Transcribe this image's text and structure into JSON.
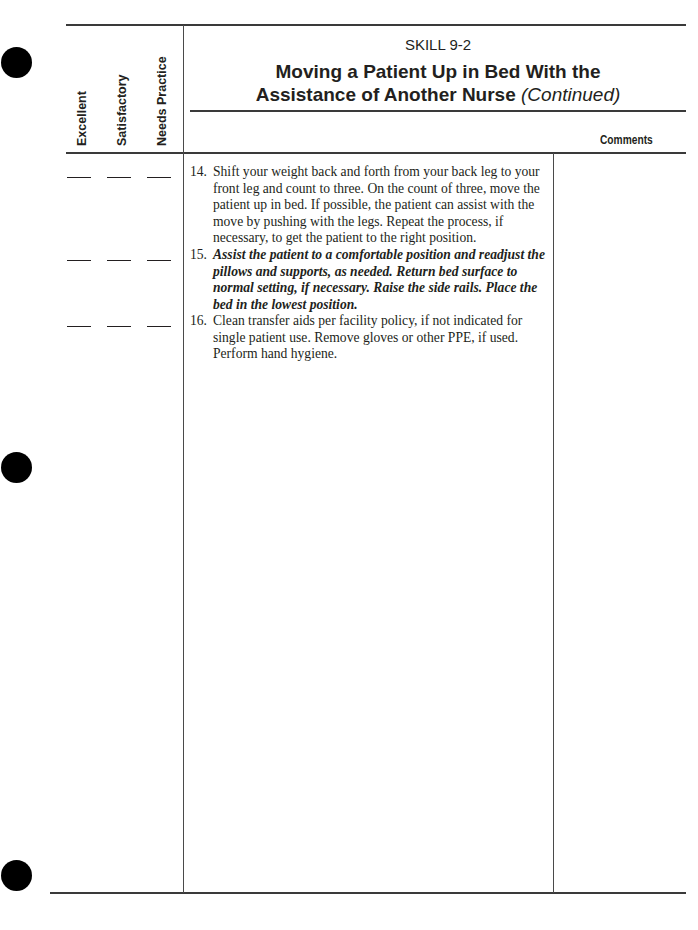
{
  "header": {
    "skill_number": "SKILL 9-2",
    "title_line1": "Moving a Patient Up in Bed With the",
    "title_line2": "Assistance of Another Nurse",
    "title_continued": "(Continued)",
    "rating_columns": [
      "Excellent",
      "Satisfactory",
      "Needs Practice"
    ],
    "comments_label": "Comments"
  },
  "steps": [
    {
      "number": "14.",
      "text": "Shift your weight back and forth from your back leg to your front leg and count to three. On the count of three, move the patient up in bed. If possible, the patient can assist with the move by pushing with the legs. Repeat the process, if necessary, to get the patient to the right position.",
      "emphasis": false,
      "ratings": [
        "",
        "",
        ""
      ]
    },
    {
      "number": "15.",
      "text": "Assist the patient to a comfortable position and readjust the pillows and supports, as needed. Return bed surface to normal setting, if necessary. Raise the side rails. Place the bed in the lowest position.",
      "emphasis": true,
      "ratings": [
        "",
        "",
        ""
      ]
    },
    {
      "number": "16.",
      "text": "Clean transfer aids per facility policy, if not indicated for single patient use. Remove gloves or other PPE, if used. Perform hand hygiene.",
      "emphasis": false,
      "ratings": [
        "",
        "",
        ""
      ]
    }
  ]
}
